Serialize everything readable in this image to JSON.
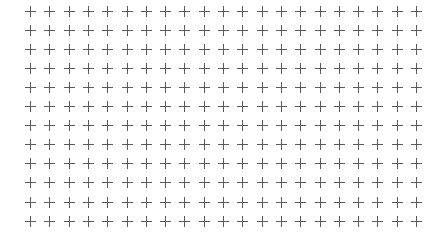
{
  "grid": {
    "marker_icon": "plus-icon",
    "columns": 21,
    "rows": 12,
    "origin_x": 30.5,
    "origin_y": 11.5,
    "spacing_x": 19.3,
    "spacing_y": 19.05,
    "marker_size": 11,
    "marker_color": "#5a5a5a",
    "background_color": "#ffffff"
  }
}
